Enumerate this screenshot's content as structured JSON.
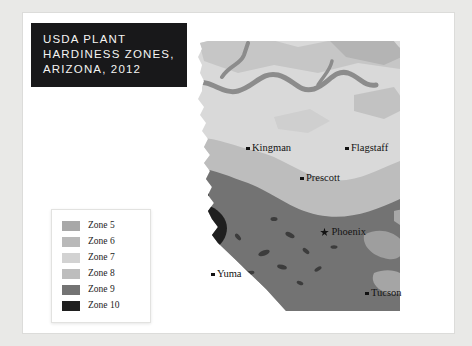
{
  "title": {
    "line1": "USDA PLANT",
    "line2": "HARDINESS ZONES,",
    "line3": "ARIZONA, 2012"
  },
  "legend": {
    "items": [
      {
        "label": "Zone 5",
        "color": "#a8a8a8"
      },
      {
        "label": "Zone 6",
        "color": "#b9b9b9"
      },
      {
        "label": "Zone 7",
        "color": "#d2d2d2"
      },
      {
        "label": "Zone 8",
        "color": "#bdbdbd"
      },
      {
        "label": "Zone 9",
        "color": "#737373"
      },
      {
        "label": "Zone 10",
        "color": "#1f1f1f"
      }
    ]
  },
  "map": {
    "cities": [
      {
        "name": "Kingman",
        "marker": "dot",
        "x": 68,
        "y": 122
      },
      {
        "name": "Flagstaff",
        "marker": "dot",
        "x": 167,
        "y": 122
      },
      {
        "name": "Prescott",
        "marker": "dot",
        "x": 122,
        "y": 152
      },
      {
        "name": "Phoenix",
        "marker": "star",
        "x": 142,
        "y": 206
      },
      {
        "name": "Yuma",
        "marker": "dot",
        "x": 33,
        "y": 248
      },
      {
        "name": "Tucson",
        "marker": "dot",
        "x": 187,
        "y": 267
      }
    ],
    "colors": {
      "zone5": "#a8a8a8",
      "zone6": "#b9b9b9",
      "zone7": "#d9d9d9",
      "zone8": "#bdbdbd",
      "zone9": "#737373",
      "zone10": "#1f1f1f",
      "canyon": "#8c8c8c"
    }
  }
}
